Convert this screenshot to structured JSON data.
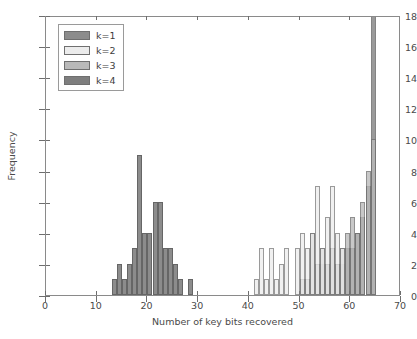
{
  "chart_data": {
    "type": "bar",
    "title": "",
    "subtitle": "",
    "xlabel": "Number of key bits recovered",
    "ylabel": "Frequency",
    "xlim": [
      0,
      70
    ],
    "ylim": [
      0,
      18
    ],
    "xticks": [
      0,
      10,
      20,
      30,
      40,
      50,
      60,
      70
    ],
    "yticks": [
      0,
      2,
      4,
      6,
      8,
      10,
      12,
      14,
      16,
      18
    ],
    "xticklabels": [
      "0",
      "10",
      "20",
      "30",
      "40",
      "50",
      "60",
      "70"
    ],
    "yticklabels": [
      "0",
      "2",
      "4",
      "6",
      "8",
      "10",
      "12",
      "14",
      "16",
      "18"
    ],
    "grid": false,
    "legend_position": "upper left",
    "bar_width": 1,
    "overlay_mode": "overlapping-semitransparent",
    "note_clipped_bars": "the k=4 bar at x=64 extends above the top of the axes (value >= 18)",
    "legend": [
      {
        "label": "k=1",
        "color": "#8c8c8c"
      },
      {
        "label": "k=2",
        "color": "#ececec"
      },
      {
        "label": "k=3",
        "color": "#b9b9b9"
      },
      {
        "label": "k=4",
        "color": "#7e7e7e"
      }
    ],
    "series": [
      {
        "name": "k=1",
        "color": "#8c8c8c",
        "bins": [
          13,
          14,
          15,
          16,
          17,
          18,
          19,
          20,
          21,
          22,
          23,
          24,
          25,
          26,
          28
        ],
        "values": [
          1,
          2,
          1,
          2,
          3,
          9,
          4,
          4,
          6,
          6,
          3,
          3,
          2,
          1,
          1
        ]
      },
      {
        "name": "k=2",
        "color": "#ececec",
        "bins": [
          40,
          41,
          42,
          43,
          44,
          45,
          46,
          47,
          48,
          49,
          50,
          51,
          52,
          53,
          54,
          55,
          56,
          57,
          58
        ],
        "values": [
          0,
          1,
          3,
          1,
          3,
          1,
          2,
          3,
          0,
          3,
          4,
          3,
          4,
          7,
          3,
          5,
          7,
          4,
          3
        ]
      },
      {
        "name": "k=3",
        "color": "#b9b9b9",
        "bins": [
          50,
          51,
          52,
          53,
          54,
          55,
          56,
          57,
          58,
          59,
          60,
          61,
          62,
          63,
          64
        ],
        "values": [
          1,
          1,
          4,
          2,
          3,
          2,
          3,
          2,
          3,
          4,
          5,
          4,
          6,
          8,
          10
        ]
      },
      {
        "name": "k=4",
        "color": "#7e7e7e",
        "bins": [
          54,
          55,
          56,
          57,
          58,
          59,
          60,
          61,
          62,
          63,
          64
        ],
        "values": [
          2,
          2,
          3,
          2,
          2,
          3,
          3,
          4,
          5,
          7,
          18
        ]
      }
    ]
  }
}
